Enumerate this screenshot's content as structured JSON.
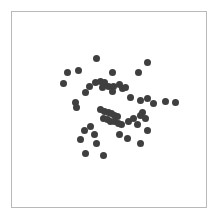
{
  "figure": {
    "width": 218,
    "height": 222,
    "background_color": "#ffffff"
  },
  "plot_area": {
    "left": 11,
    "top": 11,
    "width": 196,
    "height": 197,
    "border_color": "#b9b9b9",
    "border_width": 1,
    "background_color": "#ffffff"
  },
  "chart_data": {
    "type": "scatter",
    "title": "",
    "subtitle": "",
    "xlabel": "",
    "ylabel": "",
    "xticks": [],
    "yticks": [],
    "xticklabels": [],
    "yticklabels": [],
    "grid": false,
    "legend": false,
    "legend_position": "none",
    "annotations": [],
    "xlim": [
      0,
      1
    ],
    "ylim": [
      0,
      1
    ],
    "marker": {
      "shape": "circle",
      "color": "#3f3f3f",
      "size_px": 7,
      "edge": "none",
      "opacity": 1
    },
    "n_points": 55,
    "series": [
      {
        "name": "points",
        "color": "#3f3f3f",
        "x": [
          0.265,
          0.437,
          0.285,
          0.343,
          0.52,
          0.65,
          0.699,
          0.402,
          0.432,
          0.455,
          0.478,
          0.468,
          0.497,
          0.525,
          0.552,
          0.568,
          0.586,
          0.516,
          0.38,
          0.326,
          0.33,
          0.612,
          0.66,
          0.7,
          0.728,
          0.79,
          0.845,
          0.672,
          0.455,
          0.478,
          0.495,
          0.512,
          0.529,
          0.546,
          0.47,
          0.49,
          0.51,
          0.53,
          0.548,
          0.565,
          0.6,
          0.625,
          0.645,
          0.662,
          0.69,
          0.404,
          0.372,
          0.424,
          0.7,
          0.552,
          0.594,
          0.352,
          0.438,
          0.66,
          0.38,
          0.47
        ],
        "y": [
          0.632,
          0.76,
          0.688,
          0.7,
          0.692,
          0.692,
          0.74,
          0.62,
          0.64,
          0.646,
          0.636,
          0.612,
          0.62,
          0.618,
          0.63,
          0.606,
          0.614,
          0.592,
          0.588,
          0.535,
          0.512,
          0.56,
          0.548,
          0.556,
          0.53,
          0.542,
          0.538,
          0.486,
          0.498,
          0.49,
          0.484,
          0.478,
          0.47,
          0.462,
          0.452,
          0.448,
          0.44,
          0.436,
          0.43,
          0.424,
          0.438,
          0.452,
          0.424,
          0.47,
          0.454,
          0.412,
          0.39,
          0.372,
          0.392,
          0.372,
          0.352,
          0.344,
          0.326,
          0.326,
          0.272,
          0.264
        ]
      }
    ]
  }
}
